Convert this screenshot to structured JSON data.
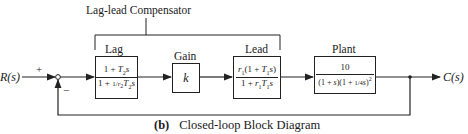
{
  "diagram": {
    "title": "Lag-lead Compensator",
    "caption_label": "(b)",
    "caption_text": "Closed-loop Block Diagram",
    "input_label": "R(s)",
    "output_label": "C(s)",
    "sum_plus": "+",
    "sum_minus": "−",
    "blocks": [
      {
        "name": "Lag",
        "num": "1 + T₂s",
        "den": "1 + (1/r₂)T₂s"
      },
      {
        "name": "Gain",
        "value": "k"
      },
      {
        "name": "Lead",
        "num": "r₁(1 + T₁s)",
        "den": "1 + r₁T₁s"
      },
      {
        "name": "Plant",
        "num": "10",
        "den": "(1 + s)(1 + (1/4)s)²"
      }
    ]
  }
}
